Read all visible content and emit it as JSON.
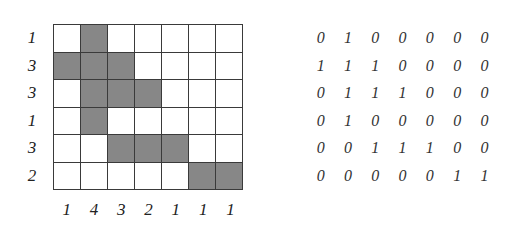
{
  "diagram": {
    "row_counts": [
      "1",
      "3",
      "3",
      "1",
      "3",
      "2"
    ],
    "column_counts": [
      "1",
      "4",
      "3",
      "2",
      "1",
      "1",
      "1"
    ],
    "grid": [
      [
        0,
        1,
        0,
        0,
        0,
        0,
        0
      ],
      [
        1,
        1,
        1,
        0,
        0,
        0,
        0
      ],
      [
        0,
        1,
        1,
        1,
        0,
        0,
        0
      ],
      [
        0,
        1,
        0,
        0,
        0,
        0,
        0
      ],
      [
        0,
        0,
        1,
        1,
        1,
        0,
        0
      ],
      [
        0,
        0,
        0,
        0,
        0,
        1,
        1
      ]
    ],
    "matrix_text": [
      [
        "0",
        "1",
        "0",
        "0",
        "0",
        "0",
        "0"
      ],
      [
        "1",
        "1",
        "1",
        "0",
        "0",
        "0",
        "0"
      ],
      [
        "0",
        "1",
        "1",
        "1",
        "0",
        "0",
        "0"
      ],
      [
        "0",
        "1",
        "0",
        "0",
        "0",
        "0",
        "0"
      ],
      [
        "0",
        "0",
        "1",
        "1",
        "1",
        "0",
        "0"
      ],
      [
        "0",
        "0",
        "0",
        "0",
        "0",
        "1",
        "1"
      ]
    ],
    "colors": {
      "filled": "#878787",
      "empty": "#ffffff",
      "border": "#3a3a3a"
    }
  }
}
